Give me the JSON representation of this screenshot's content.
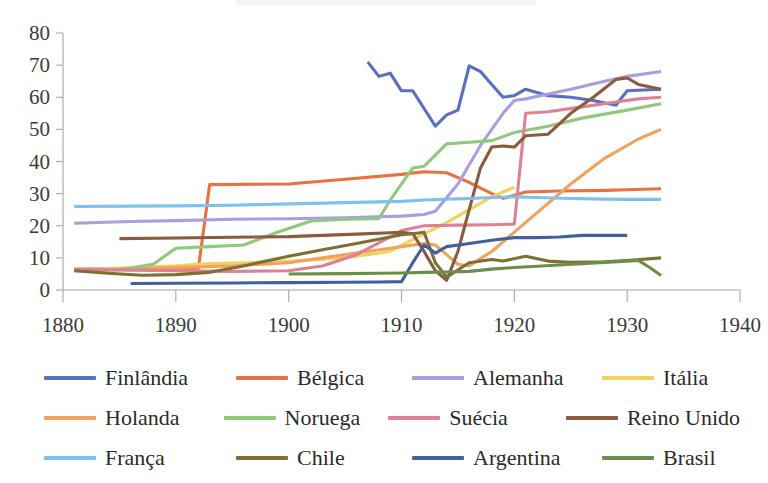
{
  "chart_data": {
    "type": "line",
    "title": "",
    "subtitle": "",
    "xlabel": "",
    "ylabel": "",
    "xlim": [
      1880,
      1940
    ],
    "ylim": [
      0,
      80
    ],
    "xticks": [
      1880,
      1890,
      1900,
      1910,
      1920,
      1930,
      1940
    ],
    "yticks": [
      0,
      10,
      20,
      30,
      40,
      50,
      60,
      70,
      80
    ],
    "grid": false,
    "legend_position": "bottom",
    "legend_columns": 4,
    "series": [
      {
        "name": "Finlândia",
        "color": "#5b6fc0",
        "points": [
          [
            1907,
            71.0
          ],
          [
            1908,
            66.5
          ],
          [
            1909,
            67.5
          ],
          [
            1910,
            62.0
          ],
          [
            1911,
            62.0
          ],
          [
            1912,
            56.5
          ],
          [
            1913,
            51.0
          ],
          [
            1914,
            54.5
          ],
          [
            1915,
            56.0
          ],
          [
            1916,
            69.8
          ],
          [
            1917,
            68.0
          ],
          [
            1918,
            64.0
          ],
          [
            1919,
            60.0
          ],
          [
            1920,
            60.5
          ],
          [
            1921,
            62.5
          ],
          [
            1922,
            61.5
          ],
          [
            1923,
            60.5
          ],
          [
            1925,
            60.0
          ],
          [
            1927,
            59.0
          ],
          [
            1929,
            57.5
          ],
          [
            1930,
            62.0
          ],
          [
            1933,
            62.5
          ]
        ]
      },
      {
        "name": "Bélgica",
        "color": "#e8713f",
        "points": [
          [
            1881,
            6.5
          ],
          [
            1886,
            6.6
          ],
          [
            1890,
            6.7
          ],
          [
            1892,
            6.8
          ],
          [
            1893,
            32.8
          ],
          [
            1900,
            33.0
          ],
          [
            1905,
            34.5
          ],
          [
            1910,
            36.0
          ],
          [
            1912,
            36.8
          ],
          [
            1914,
            36.5
          ],
          [
            1916,
            33.5
          ],
          [
            1918,
            30.0
          ],
          [
            1919,
            28.5
          ],
          [
            1920,
            29.5
          ],
          [
            1921,
            30.5
          ],
          [
            1924,
            30.8
          ],
          [
            1928,
            31.0
          ],
          [
            1930,
            31.2
          ],
          [
            1933,
            31.5
          ]
        ]
      },
      {
        "name": "Alemanha",
        "color": "#a99ee0",
        "points": [
          [
            1881,
            20.8
          ],
          [
            1886,
            21.3
          ],
          [
            1890,
            21.6
          ],
          [
            1895,
            22.0
          ],
          [
            1900,
            22.2
          ],
          [
            1905,
            22.5
          ],
          [
            1910,
            23.0
          ],
          [
            1912,
            23.5
          ],
          [
            1913,
            24.5
          ],
          [
            1915,
            33.0
          ],
          [
            1917,
            45.0
          ],
          [
            1919,
            55.0
          ],
          [
            1920,
            59.0
          ],
          [
            1921,
            59.5
          ],
          [
            1923,
            61.0
          ],
          [
            1925,
            62.5
          ],
          [
            1928,
            65.0
          ],
          [
            1930,
            66.5
          ],
          [
            1933,
            68.0
          ]
        ]
      },
      {
        "name": "Itália",
        "color": "#f2d25b",
        "points": [
          [
            1881,
            6.3
          ],
          [
            1885,
            6.8
          ],
          [
            1890,
            7.5
          ],
          [
            1893,
            8.2
          ],
          [
            1896,
            8.5
          ],
          [
            1900,
            9.0
          ],
          [
            1903,
            9.5
          ],
          [
            1906,
            10.5
          ],
          [
            1909,
            12.0
          ],
          [
            1910,
            14.0
          ],
          [
            1912,
            17.5
          ],
          [
            1914,
            21.0
          ],
          [
            1916,
            25.0
          ],
          [
            1918,
            29.0
          ],
          [
            1919,
            30.5
          ],
          [
            1920,
            32.0
          ]
        ]
      },
      {
        "name": "Holanda",
        "color": "#f0a35e",
        "points": [
          [
            1881,
            6.2
          ],
          [
            1886,
            6.5
          ],
          [
            1890,
            7.0
          ],
          [
            1895,
            7.5
          ],
          [
            1900,
            8.5
          ],
          [
            1903,
            10.0
          ],
          [
            1906,
            11.5
          ],
          [
            1909,
            13.0
          ],
          [
            1910,
            13.5
          ],
          [
            1912,
            14.5
          ],
          [
            1913,
            14.0
          ],
          [
            1914,
            11.0
          ],
          [
            1915,
            8.0
          ],
          [
            1916,
            7.5
          ],
          [
            1918,
            12.0
          ],
          [
            1920,
            18.0
          ],
          [
            1922,
            24.0
          ],
          [
            1925,
            33.0
          ],
          [
            1928,
            41.0
          ],
          [
            1931,
            47.0
          ],
          [
            1933,
            50.0
          ]
        ]
      },
      {
        "name": "Noruega",
        "color": "#8fc97a",
        "points": [
          [
            1881,
            6.0
          ],
          [
            1885,
            6.3
          ],
          [
            1888,
            8.0
          ],
          [
            1890,
            13.0
          ],
          [
            1893,
            13.5
          ],
          [
            1896,
            14.0
          ],
          [
            1899,
            18.0
          ],
          [
            1902,
            21.5
          ],
          [
            1905,
            22.0
          ],
          [
            1908,
            22.2
          ],
          [
            1909,
            28.0
          ],
          [
            1911,
            38.0
          ],
          [
            1912,
            38.5
          ],
          [
            1914,
            45.5
          ],
          [
            1916,
            46.0
          ],
          [
            1918,
            46.5
          ],
          [
            1920,
            49.0
          ],
          [
            1923,
            51.0
          ],
          [
            1926,
            53.5
          ],
          [
            1930,
            56.0
          ],
          [
            1933,
            58.0
          ]
        ]
      },
      {
        "name": "Suécia",
        "color": "#dd8294",
        "points": [
          [
            1881,
            6.4
          ],
          [
            1886,
            6.2
          ],
          [
            1890,
            6.0
          ],
          [
            1895,
            5.8
          ],
          [
            1900,
            6.0
          ],
          [
            1903,
            7.5
          ],
          [
            1906,
            11.0
          ],
          [
            1909,
            16.5
          ],
          [
            1910,
            18.5
          ],
          [
            1912,
            20.0
          ],
          [
            1915,
            20.2
          ],
          [
            1918,
            20.3
          ],
          [
            1920,
            20.5
          ],
          [
            1921,
            55.0
          ],
          [
            1923,
            55.5
          ],
          [
            1926,
            57.0
          ],
          [
            1929,
            58.5
          ],
          [
            1931,
            59.5
          ],
          [
            1933,
            60.0
          ]
        ]
      },
      {
        "name": "Reino Unido",
        "color": "#8a5b3d",
        "points": [
          [
            1885,
            16.0
          ],
          [
            1890,
            16.2
          ],
          [
            1895,
            16.4
          ],
          [
            1900,
            16.6
          ],
          [
            1903,
            17.0
          ],
          [
            1906,
            17.4
          ],
          [
            1909,
            17.8
          ],
          [
            1910,
            18.0
          ],
          [
            1911,
            17.5
          ],
          [
            1912,
            12.0
          ],
          [
            1913,
            6.0
          ],
          [
            1914,
            3.0
          ],
          [
            1915,
            12.0
          ],
          [
            1916,
            25.0
          ],
          [
            1917,
            38.0
          ],
          [
            1918,
            44.5
          ],
          [
            1919,
            44.8
          ],
          [
            1920,
            44.5
          ],
          [
            1921,
            48.0
          ],
          [
            1923,
            48.5
          ],
          [
            1925,
            55.0
          ],
          [
            1927,
            60.0
          ],
          [
            1929,
            65.5
          ],
          [
            1930,
            66.0
          ],
          [
            1931,
            64.0
          ],
          [
            1933,
            62.5
          ]
        ]
      },
      {
        "name": "França",
        "color": "#7ec0ef",
        "points": [
          [
            1881,
            26.0
          ],
          [
            1886,
            26.1
          ],
          [
            1890,
            26.2
          ],
          [
            1895,
            26.4
          ],
          [
            1900,
            26.8
          ],
          [
            1905,
            27.2
          ],
          [
            1910,
            27.6
          ],
          [
            1912,
            28.0
          ],
          [
            1914,
            28.3
          ],
          [
            1916,
            28.5
          ],
          [
            1918,
            28.8
          ],
          [
            1920,
            29.0
          ],
          [
            1922,
            28.8
          ],
          [
            1925,
            28.5
          ],
          [
            1928,
            28.3
          ],
          [
            1930,
            28.2
          ],
          [
            1933,
            28.2
          ]
        ]
      },
      {
        "name": "Chile",
        "color": "#7d7032",
        "points": [
          [
            1881,
            6.0
          ],
          [
            1884,
            5.2
          ],
          [
            1887,
            4.6
          ],
          [
            1890,
            4.8
          ],
          [
            1893,
            5.5
          ],
          [
            1896,
            7.5
          ],
          [
            1900,
            10.5
          ],
          [
            1903,
            12.5
          ],
          [
            1906,
            14.5
          ],
          [
            1909,
            16.5
          ],
          [
            1910,
            17.2
          ],
          [
            1911,
            17.5
          ],
          [
            1912,
            18.0
          ],
          [
            1913,
            8.5
          ],
          [
            1914,
            4.0
          ],
          [
            1916,
            8.5
          ],
          [
            1918,
            9.5
          ],
          [
            1919,
            9.0
          ],
          [
            1921,
            10.5
          ],
          [
            1923,
            9.0
          ],
          [
            1925,
            8.6
          ],
          [
            1928,
            8.8
          ],
          [
            1930,
            9.2
          ],
          [
            1933,
            10.0
          ]
        ]
      },
      {
        "name": "Argentina",
        "color": "#41619e",
        "points": [
          [
            1886,
            2.0
          ],
          [
            1890,
            2.1
          ],
          [
            1895,
            2.2
          ],
          [
            1900,
            2.3
          ],
          [
            1905,
            2.4
          ],
          [
            1908,
            2.5
          ],
          [
            1910,
            2.6
          ],
          [
            1911,
            8.5
          ],
          [
            1912,
            14.0
          ],
          [
            1913,
            11.5
          ],
          [
            1914,
            13.5
          ],
          [
            1916,
            14.5
          ],
          [
            1918,
            15.5
          ],
          [
            1920,
            16.3
          ],
          [
            1922,
            16.3
          ],
          [
            1924,
            16.5
          ],
          [
            1926,
            17.0
          ],
          [
            1928,
            17.0
          ],
          [
            1930,
            17.0
          ]
        ]
      },
      {
        "name": "Brasil",
        "color": "#6b8f4b",
        "points": [
          [
            1900,
            5.0
          ],
          [
            1905,
            5.1
          ],
          [
            1908,
            5.2
          ],
          [
            1910,
            5.3
          ],
          [
            1912,
            5.5
          ],
          [
            1914,
            5.6
          ],
          [
            1916,
            5.8
          ],
          [
            1918,
            6.5
          ],
          [
            1920,
            7.0
          ],
          [
            1922,
            7.4
          ],
          [
            1924,
            7.8
          ],
          [
            1926,
            8.2
          ],
          [
            1928,
            8.6
          ],
          [
            1930,
            9.0
          ],
          [
            1931,
            9.2
          ],
          [
            1932,
            7.0
          ],
          [
            1933,
            4.5
          ]
        ]
      }
    ]
  },
  "axes": {
    "y_tick_labels": [
      "80",
      "70",
      "60",
      "50",
      "40",
      "30",
      "20",
      "10",
      "0"
    ],
    "x_tick_labels": [
      "1880",
      "1890",
      "1900",
      "1910",
      "1920",
      "1930",
      "1940"
    ]
  },
  "legend": {
    "rows": [
      [
        {
          "label": "Finlândia",
          "color": "#5b6fc0"
        },
        {
          "label": "Bélgica",
          "color": "#e8713f"
        },
        {
          "label": "Alemanha",
          "color": "#a99ee0"
        },
        {
          "label": "Itália",
          "color": "#f2d25b"
        }
      ],
      [
        {
          "label": "Holanda",
          "color": "#f0a35e"
        },
        {
          "label": "Noruega",
          "color": "#8fc97a"
        },
        {
          "label": "Suécia",
          "color": "#dd8294"
        },
        {
          "label": "Reino Unido",
          "color": "#8a5b3d"
        }
      ],
      [
        {
          "label": "França",
          "color": "#7ec0ef"
        },
        {
          "label": "Chile",
          "color": "#7d7032"
        },
        {
          "label": "Argentina",
          "color": "#41619e"
        },
        {
          "label": "Brasil",
          "color": "#6b8f4b"
        }
      ]
    ]
  }
}
